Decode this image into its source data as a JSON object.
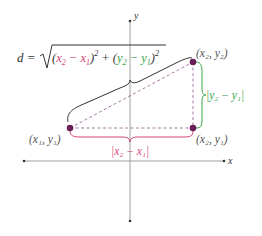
{
  "axes": {
    "x_label": "x",
    "y_label": "y"
  },
  "formula": {
    "lhs": "d =",
    "term1_open": "(",
    "term1_x2": "x",
    "term1_x2_sub": "2",
    "term1_minus": " − ",
    "term1_x1": "x",
    "term1_x1_sub": "1",
    "term1_close": ")",
    "term1_exp": "2",
    "plus": " + ",
    "term2_open": "(",
    "term2_y2": "y",
    "term2_y2_sub": "2",
    "term2_minus": " − ",
    "term2_y1": "y",
    "term2_y1_sub": "1",
    "term2_close": ")",
    "term2_exp": "2"
  },
  "points": {
    "p1": {
      "label": "(x₁, y₁)"
    },
    "p2": {
      "label": "(x₂, y₂)"
    },
    "p3": {
      "label": "(x₂, y₁)"
    }
  },
  "horizontal_distance": {
    "label": "|x₂ − x₁|"
  },
  "vertical_distance": {
    "label": "|y₂ − y₁|"
  },
  "colors": {
    "point": "#6b1f5a",
    "x_term": "#d6457a",
    "y_term": "#3aa54a",
    "dashed": "#9a6a9a",
    "axis": "#666666",
    "text": "#333333"
  }
}
